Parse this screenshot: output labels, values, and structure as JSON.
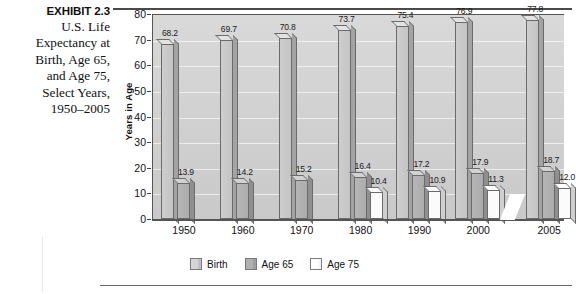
{
  "exhibit": {
    "number_label": "EXHIBIT 2.3",
    "description_lines": [
      "U.S. Life",
      "Expectancy at",
      "Birth, Age 65,",
      "and Age 75,",
      "Select Years,",
      "1950–2005"
    ]
  },
  "chart_data": {
    "type": "bar",
    "title": "",
    "xlabel": "",
    "ylabel": "Years in Age",
    "categories": [
      "1950",
      "1960",
      "1970",
      "1980",
      "1990",
      "2000",
      "2005"
    ],
    "series": [
      {
        "name": "Birth",
        "color": "#cecece",
        "values": [
          68.2,
          69.7,
          70.8,
          73.7,
          75.4,
          76.9,
          77.8
        ]
      },
      {
        "name": "Age 65",
        "color": "#b6b6b6",
        "values": [
          13.9,
          14.2,
          15.2,
          16.4,
          17.2,
          17.9,
          18.7
        ]
      },
      {
        "name": "Age 75",
        "color": "#ffffff",
        "values": [
          null,
          null,
          null,
          10.4,
          10.9,
          11.3,
          12.0
        ]
      }
    ],
    "ylim": [
      0,
      80
    ],
    "yticks": [
      0,
      10,
      20,
      30,
      40,
      50,
      60,
      70,
      80
    ],
    "ytick_labels": [
      "0",
      "10",
      "20",
      "30",
      "40",
      "50",
      "60",
      "70",
      "80"
    ],
    "grid": true,
    "axis_break": true,
    "axis_break_after_category": "2000",
    "legend_position": "bottom",
    "legend": [
      "Birth",
      "Age 65",
      "Age 75"
    ],
    "data_labels": {
      "1950": [
        "68.2",
        "13.9",
        ""
      ],
      "1960": [
        "69.7",
        "14.2",
        ""
      ],
      "1970": [
        "70.8",
        "15.2",
        ""
      ],
      "1980": [
        "73.7",
        "16.4",
        "10.4"
      ],
      "1990": [
        "75.4",
        "17.2",
        "10.9"
      ],
      "2000": [
        "76.9",
        "17.9",
        "11.3"
      ],
      "2005": [
        "77.8",
        "18.7",
        "12.0"
      ]
    }
  }
}
